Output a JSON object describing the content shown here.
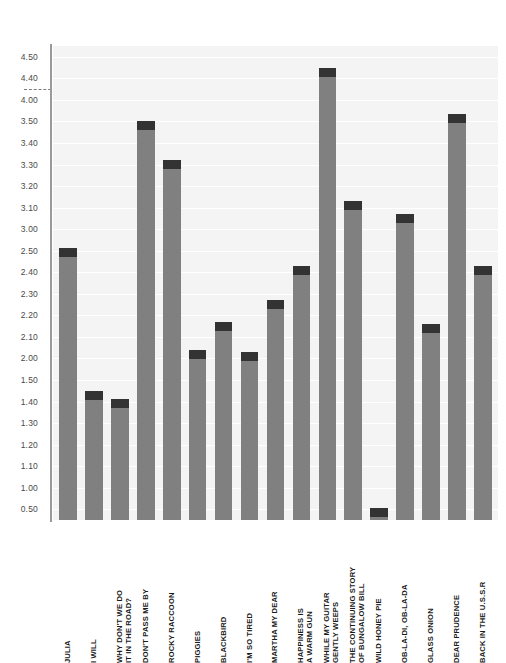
{
  "chart_data": {
    "type": "bar",
    "title": "",
    "subtitle": "",
    "xlabel": "",
    "ylabel": "",
    "legend": [],
    "grid": true,
    "orientation": "vertical",
    "bar_color": "#808080",
    "bar_cap_color": "#333333",
    "plot_background": "#f4f4f4",
    "gridline_color": "#ffffff",
    "axis_color": "#9a9a9a",
    "axis_type": "categorical-ticks",
    "break_marker": {
      "between": [
        "4.40",
        "4.00"
      ],
      "style": "dashed"
    },
    "ytick_labels": [
      "4.50",
      "4.40",
      "4.00",
      "3.50",
      "3.40",
      "3.30",
      "3.20",
      "3.10",
      "3.00",
      "2.50",
      "2.40",
      "2.30",
      "2.20",
      "2.10",
      "2.00",
      "1.50",
      "1.40",
      "1.30",
      "1.20",
      "1.10",
      "1.00",
      "0.50"
    ],
    "categories": [
      "JULIA",
      "I WILL",
      "WHY DON'T WE DO\nIT IN THE ROAD?",
      "DON'T PASS ME BY",
      "ROCKY RACCOON",
      "PIGGIES",
      "BLACKBIRD",
      "I'M SO TIRED",
      "MARTHA MY DEAR",
      "HAPPINESS IS\nA WARM GUN",
      "WHILE MY GUITAR\nGENTLY WEEPS",
      "THE CONTINUING STORY\nOF BUNGALOW BILL",
      "WILD HONEY PIE",
      "OB-LA-DI, OB-LA-DA",
      "GLASS ONION",
      "DEAR PRUDENCE",
      "BACK IN THE U.S.S.R"
    ],
    "values": [
      2.56,
      1.45,
      1.41,
      3.5,
      3.32,
      2.04,
      2.17,
      2.03,
      2.27,
      2.43,
      4.45,
      3.13,
      0.52,
      3.07,
      2.16,
      3.68,
      2.43
    ],
    "ylim": [
      0,
      4.55
    ]
  }
}
